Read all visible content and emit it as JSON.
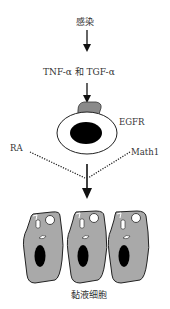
{
  "diagram": {
    "nodes": {
      "infection": {
        "label": "感染"
      },
      "cytokines": {
        "label": "TNF-α 和 TGF-α"
      },
      "receptor": {
        "label": "EGFR"
      },
      "ra": {
        "label": "RA"
      },
      "math1": {
        "label": "Math1"
      },
      "mucous_cells": {
        "label": "黏液细胞"
      }
    },
    "edges": [
      {
        "from": "infection",
        "to": "cytokines",
        "style": "solid-arrow"
      },
      {
        "from": "cytokines",
        "to": "receptor",
        "style": "solid-arrow"
      },
      {
        "from": "receptor",
        "to": "mucous_cells",
        "style": "solid-arrow"
      },
      {
        "from": "ra",
        "to": "mucous_cells",
        "style": "dotted"
      },
      {
        "from": "math1",
        "to": "mucous_cells",
        "style": "dotted"
      }
    ],
    "colors": {
      "cell_fill": "#a9a9a9",
      "nucleus": "#000000",
      "receptor_fill": "#8a8a8a",
      "line": "#111111"
    },
    "cell_count": 3
  }
}
